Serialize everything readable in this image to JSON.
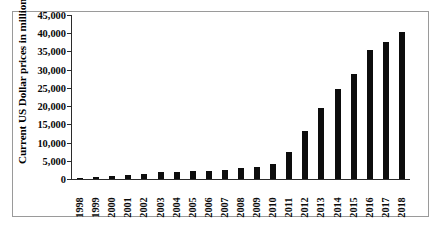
{
  "chart_data": {
    "type": "bar",
    "title": "",
    "subtitle": "",
    "xlabel": "",
    "ylabel": "Current US Dollar prices in millions",
    "categories": [
      "1998",
      "1999",
      "2000",
      "2001",
      "2002",
      "2003",
      "2004",
      "2005",
      "2006",
      "2007",
      "2008",
      "2009",
      "2010",
      "2011",
      "2012",
      "2013",
      "2014",
      "2015",
      "2016",
      "2017",
      "2018"
    ],
    "values": [
      300,
      600,
      800,
      1000,
      1300,
      1800,
      1900,
      2200,
      2200,
      2500,
      3100,
      3400,
      4200,
      7500,
      13200,
      19500,
      24600,
      28900,
      35300,
      37700,
      40400
    ],
    "ylim": [
      0,
      45000
    ],
    "ytick_values": [
      0,
      5000,
      10000,
      15000,
      20000,
      25000,
      30000,
      35000,
      40000,
      45000
    ],
    "ytick_labels": [
      "0",
      "5,000",
      "10,000",
      "15,000",
      "20,000",
      "25,000",
      "30,000",
      "35,000",
      "40,000",
      "45,000"
    ],
    "grid": false,
    "legend": false,
    "legend_position": "none",
    "series": [
      {
        "name": "",
        "color": "#0d0d0d",
        "values": [
          300,
          600,
          800,
          1000,
          1300,
          1800,
          1900,
          2200,
          2200,
          2500,
          3100,
          3400,
          4200,
          7500,
          13200,
          19500,
          24600,
          28900,
          35300,
          37700,
          40400
        ]
      }
    ]
  },
  "colors": {
    "bar": "#0d0d0d",
    "axis": "#2b2b2b",
    "frame": "#9a9a9a",
    "text": "#0a0a0a",
    "background": "#ffffff"
  }
}
